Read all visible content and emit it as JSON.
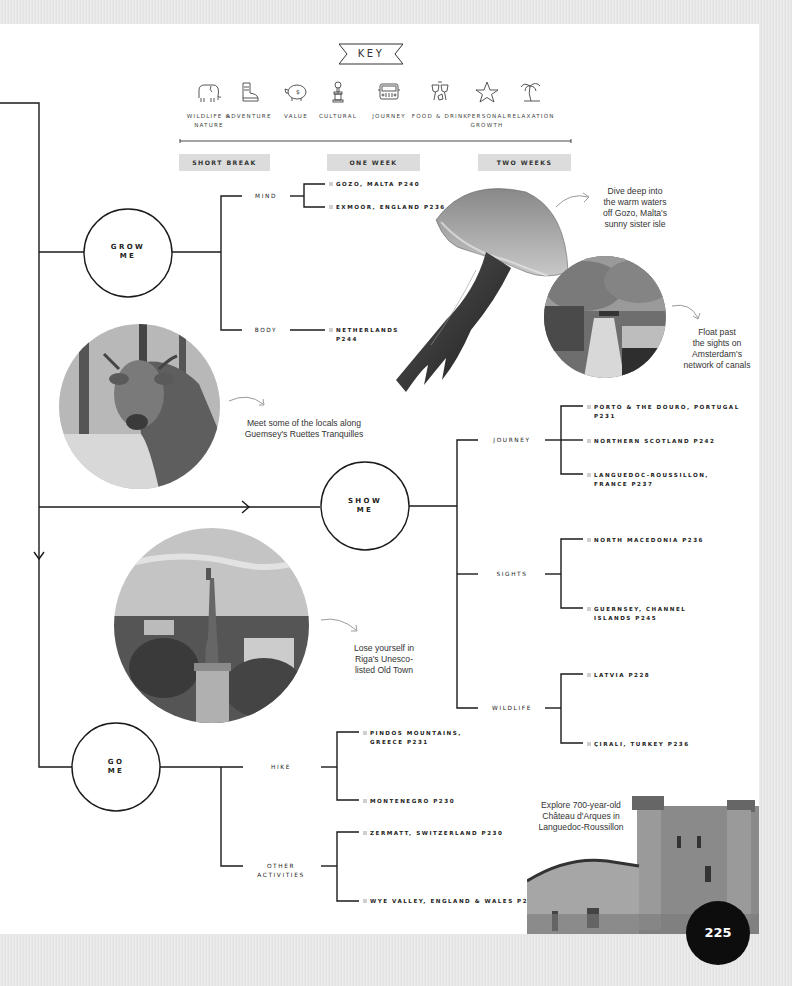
{
  "key": {
    "title": "KEY",
    "items": [
      {
        "icon": "elephant-icon",
        "label": "WILDLIFE & NATURE"
      },
      {
        "icon": "boot-icon",
        "label": "ADVENTURE"
      },
      {
        "icon": "piggy-bank-icon",
        "label": "VALUE"
      },
      {
        "icon": "statue-icon",
        "label": "CULTURAL"
      },
      {
        "icon": "jeep-icon",
        "label": "JOURNEY"
      },
      {
        "icon": "wine-glasses-icon",
        "label": "FOOD & DRINK"
      },
      {
        "icon": "star-icon",
        "label": "PERSONAL GROWTH"
      },
      {
        "icon": "palm-tree-icon",
        "label": "RELAXATION"
      }
    ],
    "durations": [
      "SHORT BREAK",
      "ONE WEEK",
      "TWO WEEKS"
    ]
  },
  "hubs": {
    "grow": {
      "label_line1": "GROW",
      "label_line2": "ME",
      "categories": [
        {
          "label": "MIND",
          "destinations": [
            "GOZO, MALTA P240",
            "EXMOOR, ENGLAND P236"
          ]
        },
        {
          "label": "BODY",
          "destinations": [
            "NETHERLANDS",
            "P244"
          ]
        }
      ]
    },
    "show": {
      "label_line1": "SHOW",
      "label_line2": "ME",
      "categories": [
        {
          "label": "JOURNEY",
          "destinations": [
            {
              "line1": "PORTO & THE DOURO, PORTUGAL",
              "line2": "P231"
            },
            {
              "line1": "NORTHERN SCOTLAND P242",
              "line2": ""
            },
            {
              "line1": "LANGUEDOC-ROUSSILLON,",
              "line2": "FRANCE P237"
            }
          ]
        },
        {
          "label": "SIGHTS",
          "destinations": [
            {
              "line1": "NORTH MACEDONIA P236",
              "line2": ""
            },
            {
              "line1": "GUERNSEY, CHANNEL",
              "line2": "ISLANDS P245"
            }
          ]
        },
        {
          "label": "WILDLIFE",
          "destinations": [
            {
              "line1": "LATVIA P228",
              "line2": ""
            },
            {
              "line1": "ÇIRALI, TURKEY P236",
              "line2": ""
            }
          ]
        }
      ]
    },
    "go": {
      "label_line1": "GO",
      "label_line2": "ME",
      "categories": [
        {
          "label_line1": "HIKE",
          "label_line2": "",
          "destinations": [
            {
              "line1": "PINDOS MOUNTAINS,",
              "line2": "GREECE P231"
            },
            {
              "line1": "MONTENEGRO P230",
              "line2": ""
            }
          ]
        },
        {
          "label_line1": "OTHER",
          "label_line2": "ACTIVITIES",
          "destinations": [
            {
              "line1": "ZERMATT, SWITZERLAND P230",
              "line2": ""
            },
            {
              "line1": "WYE VALLEY, ENGLAND & WALES P233",
              "line2": ""
            }
          ]
        }
      ]
    }
  },
  "captions": {
    "gozo": [
      "Dive deep into",
      "the warm waters",
      "off Gozo, Malta's",
      "sunny sister isle"
    ],
    "amsterdam": [
      "Float past",
      "the sights on",
      "Amsterdam's",
      "network of canals"
    ],
    "guernsey": [
      "Meet some of the locals along",
      "Guemsey's Ruettes Tranquilles"
    ],
    "riga": [
      "Lose yourself in",
      "Riga's Unesco-",
      "listed Old Town"
    ],
    "chateau": [
      "Explore 700-year-old",
      "Château d'Arques in",
      "Languedoc-Roussillon"
    ]
  },
  "images": {
    "jellyfish": "jellyfish-illustration",
    "amsterdam": "amsterdam-canal-photo",
    "cow": "cow-photo",
    "riga": "riga-freedom-monument-photo",
    "castle": "chateau-d-arques-photo"
  },
  "page_number": "225",
  "colors": {
    "line": "#1a1a1a",
    "duration_bg": "#dcdcdc",
    "bullet": "#cfcfcf",
    "page_bg": "#ffffff",
    "margin_bg": "#e9e9e9",
    "page_badge": "#0d0d0d"
  }
}
